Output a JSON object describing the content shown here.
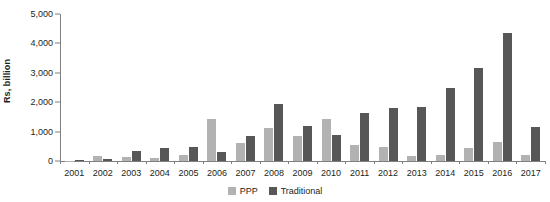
{
  "chart_data": {
    "type": "bar",
    "title": "",
    "subtitle": "",
    "xlabel": "",
    "ylabel": "Rs, billion",
    "ylim": [
      0,
      5000
    ],
    "ytick_labels": [
      "5,000",
      "4,000",
      "3,000",
      "2,000",
      "1,000",
      "0"
    ],
    "ytick_values": [
      5000,
      4000,
      3000,
      2000,
      1000,
      0
    ],
    "grid": false,
    "legend_position": "bottom-center",
    "categories": [
      "2001",
      "2002",
      "2003",
      "2004",
      "2005",
      "2006",
      "2007",
      "2008",
      "2009",
      "2010",
      "2011",
      "2012",
      "2013",
      "2014",
      "2015",
      "2016",
      "2017"
    ],
    "series": [
      {
        "name": "PPP",
        "color": "#b2b2b2",
        "values": [
          10,
          170,
          120,
          90,
          190,
          1430,
          620,
          1120,
          850,
          1430,
          530,
          460,
          160,
          190,
          430,
          650,
          190
        ]
      },
      {
        "name": "Traditional",
        "color": "#575757",
        "values": [
          20,
          80,
          330,
          450,
          470,
          310,
          840,
          1940,
          1190,
          870,
          1640,
          1800,
          1850,
          2480,
          3150,
          4340,
          1160
        ]
      }
    ]
  },
  "legend": {
    "items": [
      {
        "label": "PPP",
        "color": "#b2b2b2"
      },
      {
        "label": "Traditional",
        "color": "#575757"
      }
    ]
  }
}
